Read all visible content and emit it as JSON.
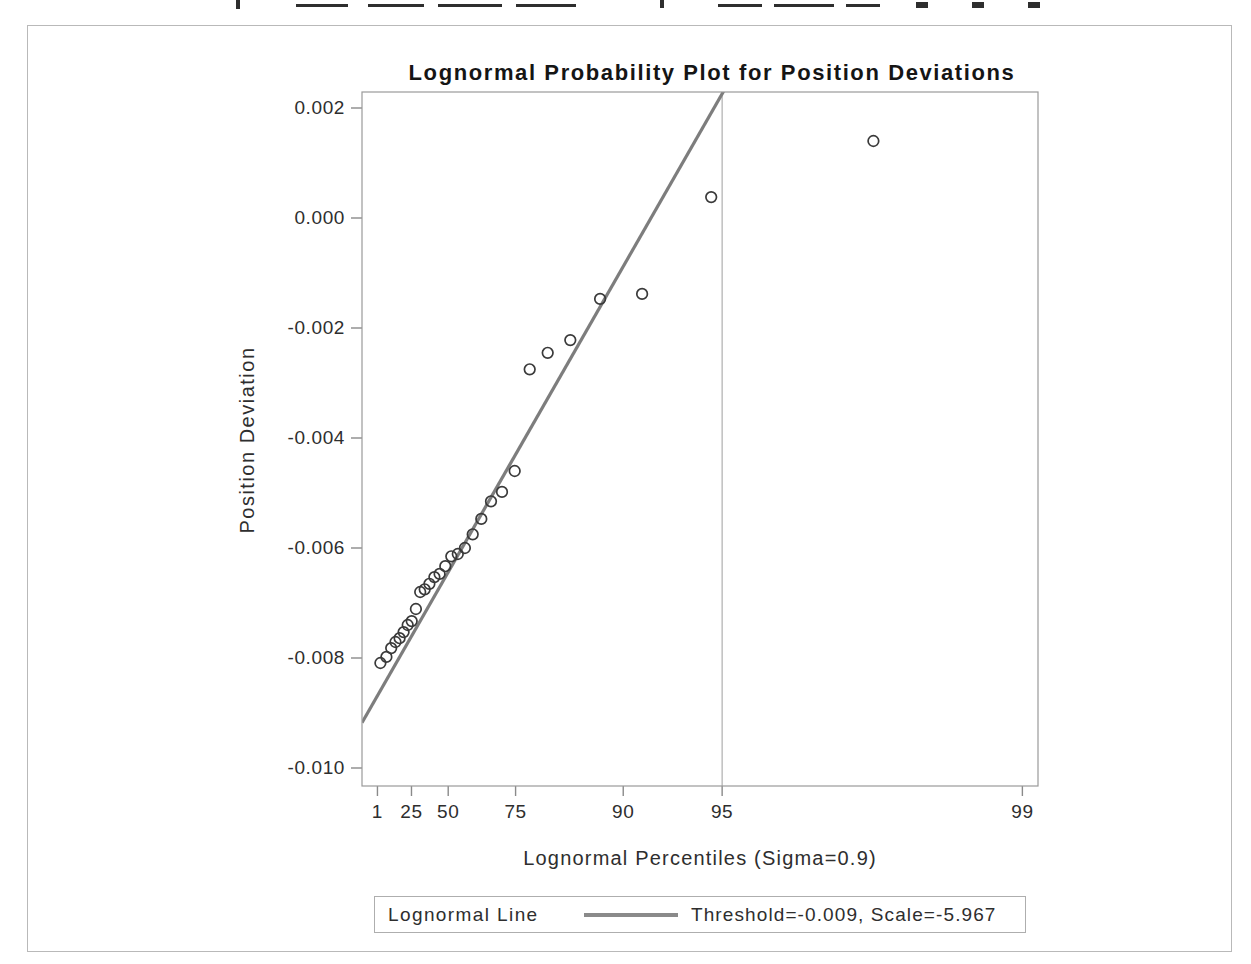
{
  "chart_data": {
    "type": "scatter",
    "title": "Lognormal Probability Plot for Position Deviations",
    "xlabel": "Lognormal Percentiles (Sigma=0.9)",
    "ylabel": "Position Deviation",
    "x_scale": "lognormal-percentile",
    "sigma": 0.9,
    "x_ticks": {
      "values": [
        1,
        25,
        50,
        75,
        90,
        95,
        99
      ],
      "labels": [
        "1",
        "25",
        "50",
        "75",
        "90",
        "95",
        "99"
      ]
    },
    "y_ticks": {
      "values": [
        0.002,
        0.0,
        -0.002,
        -0.004,
        -0.006,
        -0.008,
        -0.01
      ],
      "labels": [
        "0.002",
        "0.000",
        "-0.002",
        "-0.004",
        "-0.006",
        "-0.008",
        "-0.010"
      ]
    },
    "ylim": [
      -0.01033,
      0.00229
    ],
    "points": {
      "percentiles": [
        2.07,
        5.37,
        8.68,
        11.98,
        15.29,
        18.6,
        21.9,
        25.21,
        28.51,
        31.82,
        35.12,
        38.43,
        41.74,
        45.04,
        48.35,
        51.65,
        54.96,
        58.26,
        61.57,
        64.88,
        68.18,
        71.49,
        74.79,
        78.1,
        81.4,
        84.71,
        88.02,
        91.32,
        94.63,
        97.93
      ],
      "values": [
        -0.00809,
        -0.00798,
        -0.00782,
        -0.00771,
        -0.00764,
        -0.00753,
        -0.0074,
        -0.00733,
        -0.00711,
        -0.0068,
        -0.00675,
        -0.00665,
        -0.00653,
        -0.00647,
        -0.00633,
        -0.00615,
        -0.00611,
        -0.006,
        -0.00575,
        -0.00547,
        -0.00515,
        -0.00498,
        -0.0046,
        -0.00275,
        -0.00245,
        -0.00222,
        -0.00147,
        -0.00138,
        0.00038,
        0.0014
      ]
    },
    "fit_line": {
      "threshold": -0.009,
      "scale": -5.967
    },
    "reference_line_percentile": 95,
    "legend": {
      "label": "Lognormal Line",
      "value": "Threshold=-0.009, Scale=-5.967"
    },
    "legend_position": "bottom-center",
    "grid": "single vertical reference line at 95th percentile",
    "colors": {
      "frame": "#9a9a9a",
      "tick": "#8a8a8a",
      "marker_stroke": "#3a3a3a",
      "fit_line": "#7d7d7d",
      "reference_line": "#b5b5b5",
      "figure_border": "#b9b9b9",
      "text": "#2e2e2e",
      "background": "#ffffff"
    }
  }
}
